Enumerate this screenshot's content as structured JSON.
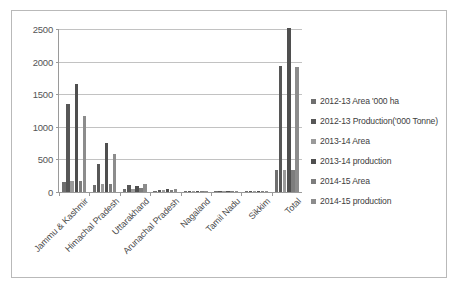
{
  "chart_data": {
    "type": "bar",
    "title": "",
    "xlabel": "",
    "ylabel": "",
    "ylim": [
      0,
      2500
    ],
    "ytick_labels": [
      "0",
      "500",
      "1000",
      "1500",
      "2000",
      "2500"
    ],
    "ytick_values": [
      0,
      500,
      1000,
      1500,
      2000,
      2500
    ],
    "grid": true,
    "legend_position": "right",
    "categories": [
      "Jammu & Kashmir",
      "Himachal Pradesh",
      "Uttarakhand",
      "Arunachal Pradesh",
      "Nagaland",
      "Tamil Nadu",
      "Sikkim",
      "Total"
    ],
    "series": [
      {
        "name": "2012-13 Area '000 ha",
        "color": "#6f6f6f",
        "values": [
          158,
          112,
          48,
          22,
          9,
          6,
          4,
          330
        ]
      },
      {
        "name": "2012-13 Production('000 Tonne)",
        "color": "#575757",
        "values": [
          1350,
          430,
          115,
          38,
          12,
          8,
          5,
          1930
        ]
      },
      {
        "name": "2013-14 Area",
        "color": "#9a9a9a",
        "values": [
          165,
          118,
          52,
          24,
          10,
          6,
          4,
          340
        ]
      },
      {
        "name": "2013-14 production",
        "color": "#4f4f4f",
        "values": [
          1655,
          750,
          90,
          42,
          13,
          8,
          5,
          2520
        ]
      },
      {
        "name": "2014-15 Area",
        "color": "#7d7d7d",
        "values": [
          170,
          120,
          55,
          25,
          10,
          7,
          4,
          345
        ]
      },
      {
        "name": "2014-15 production",
        "color": "#8c8c8c",
        "values": [
          1170,
          590,
          128,
          45,
          14,
          9,
          6,
          1910
        ]
      }
    ]
  }
}
